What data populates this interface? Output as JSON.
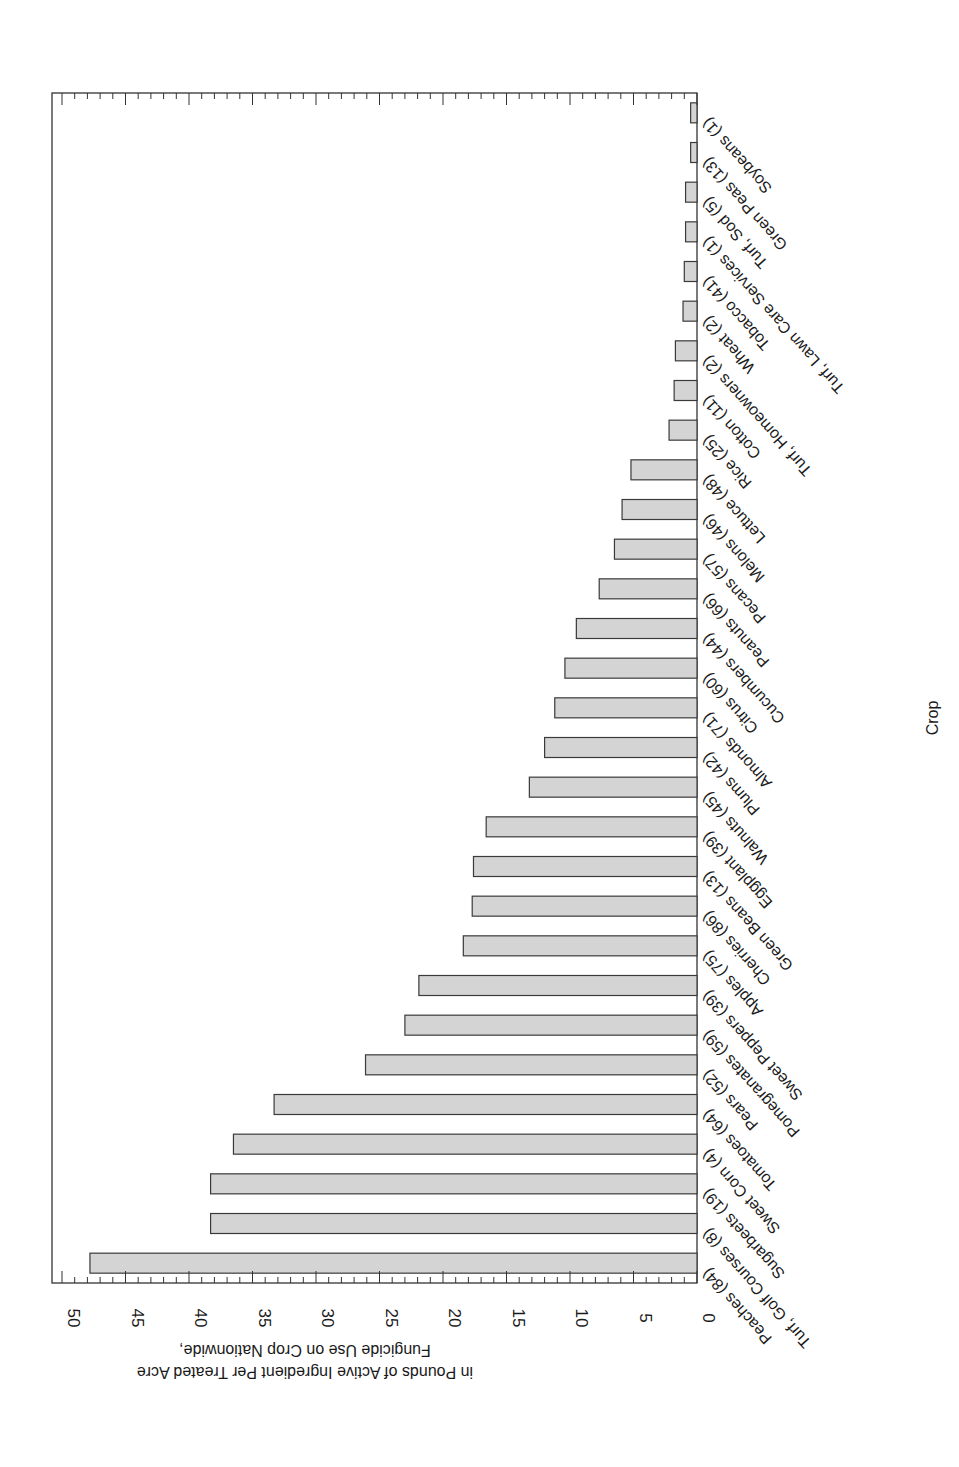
{
  "chart_data": {
    "type": "bar",
    "orientation": "horizontal, page rotated (value axis at bottom runs right-to-left, text upside down)",
    "title": "",
    "xlabel": "Crop",
    "ylabel": "Fungicide Use on Crop Nationwide, in Pounds of Active Ingredient Per Treated Acre",
    "ylabel_lines": [
      "Fungicide Use on Crop Nationwide,",
      "in Pounds of Active Ingredient Per Treated Acre"
    ],
    "ylim": [
      0,
      50
    ],
    "ticks": [
      0,
      5,
      10,
      15,
      20,
      25,
      30,
      35,
      40,
      45,
      50
    ],
    "tick_labels": [
      "0",
      "5",
      "10",
      "15",
      "20",
      "25",
      "30",
      "35",
      "40",
      "45",
      "50"
    ],
    "minor_tick_step": 1,
    "grid": false,
    "legend": "none",
    "bar_color": "#d4d4d4",
    "categories": [
      "Soybeans (1)",
      "Green Peas (13)",
      "Turf, Sod (5)",
      "Turf, Lawn Care Services (1)",
      "Tobacco (41)",
      "Wheat (2)",
      "Turf, Homeowners (2)",
      "Cotton (11)",
      "Rice (25)",
      "Lettuce (48)",
      "Melons (46)",
      "Pecans (57)",
      "Peanuts (66)",
      "Cucumbers (44)",
      "Citrus (60)",
      "Almonds (71)",
      "Plums (42)",
      "Walnuts (45)",
      "Eggplant (39)",
      "Green Beans (13)",
      "Cherries (86)",
      "Apples (75)",
      "Sweet Peppers (39)",
      "Pomegranates (59)",
      "Pears (52)",
      "Tomatoes (64)",
      "Sweet Corn (4)",
      "Sugarbeets (19)",
      "Turf, Golf Courses (8)",
      "Peaches (84)"
    ],
    "values": [
      0.5,
      0.5,
      0.9,
      0.9,
      1.0,
      1.1,
      1.7,
      1.8,
      2.2,
      5.2,
      5.9,
      6.5,
      7.7,
      9.5,
      10.4,
      11.2,
      12.0,
      13.2,
      16.6,
      17.6,
      17.7,
      18.4,
      21.9,
      23.0,
      26.1,
      33.3,
      36.5,
      38.3,
      38.3,
      47.8
    ]
  }
}
